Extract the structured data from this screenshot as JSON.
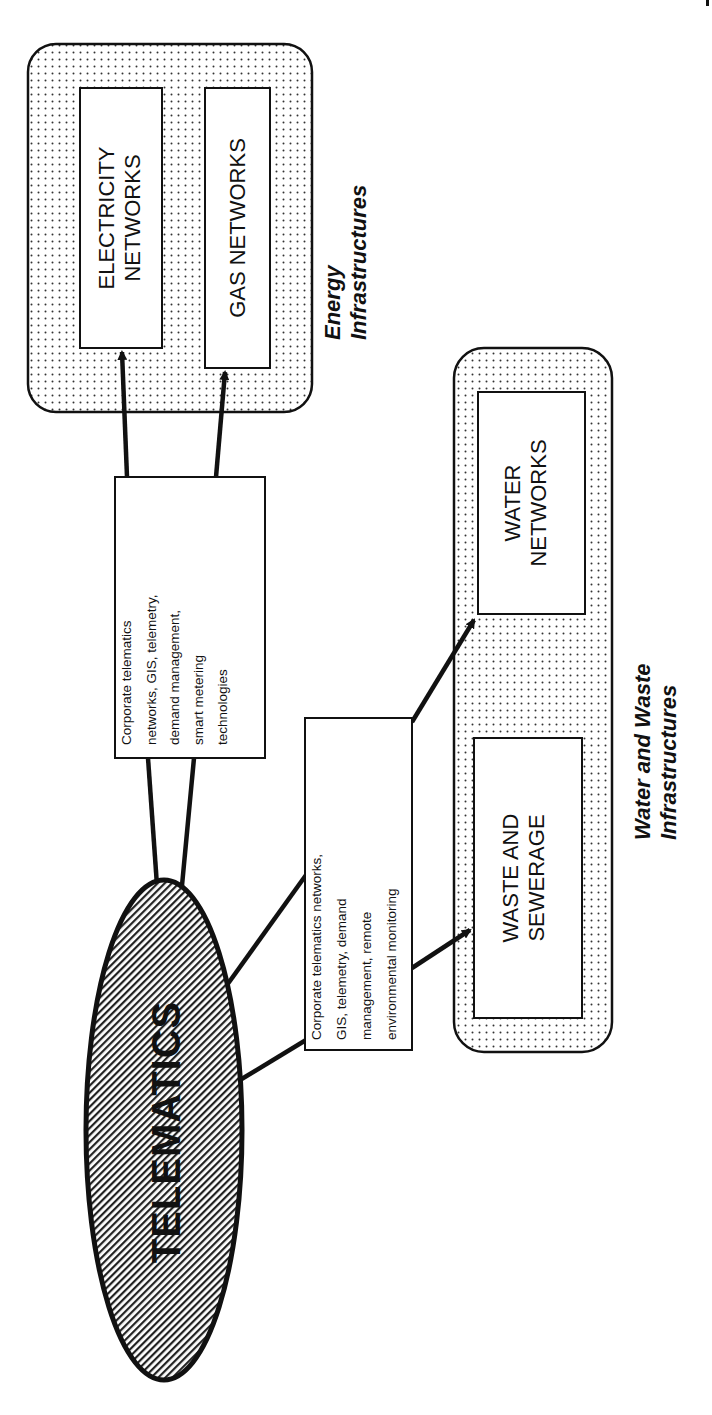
{
  "diagram": {
    "hub": {
      "label": "TELEMATICS"
    },
    "groups": [
      {
        "id": "energy",
        "label_line1": "Energy",
        "label_line2": "Infrastructures",
        "nodes": [
          {
            "id": "electricity",
            "line1": "ELECTRICITY",
            "line2": "NETWORKS"
          },
          {
            "id": "gas",
            "line1": "GAS NETWORKS",
            "line2": ""
          }
        ],
        "connector_text": [
          "Corporate telematics",
          "networks,  GIS, telemetry,",
          "demand management,",
          "smart metering",
          "technologies"
        ]
      },
      {
        "id": "water-waste",
        "label_line1": "Water  and Waste",
        "label_line2": "Infrastructures",
        "nodes": [
          {
            "id": "water",
            "line1": "WATER",
            "line2": "NETWORKS"
          },
          {
            "id": "waste",
            "line1": "WASTE AND",
            "line2": "SEWERAGE"
          }
        ],
        "connector_text": [
          "Corporate telematics networks,",
          "GIS, telemetry, demand",
          "management, remote",
          "environmental monitoring"
        ]
      }
    ],
    "colors": {
      "stroke": "#111111",
      "background": "#ffffff",
      "dot_fill": "#333333",
      "hatch": "#222222"
    }
  }
}
